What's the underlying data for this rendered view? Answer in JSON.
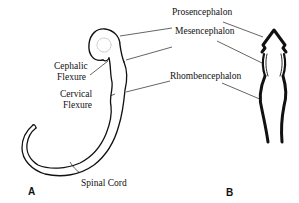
{
  "labels": {
    "prosencephalon": "Prosencephalon",
    "mesencephalon": "Mesencephalon",
    "rhombencephalon": "Rhombencephalon",
    "cephalic_flexure_1": "Cephalic",
    "cephalic_flexure_2": "Flexure",
    "cervical_flexure_1": "Cervical",
    "cervical_flexure_2": "Flexure",
    "spinal_cord": "Spinal Cord"
  },
  "panels": {
    "a": "A",
    "b": "B"
  }
}
